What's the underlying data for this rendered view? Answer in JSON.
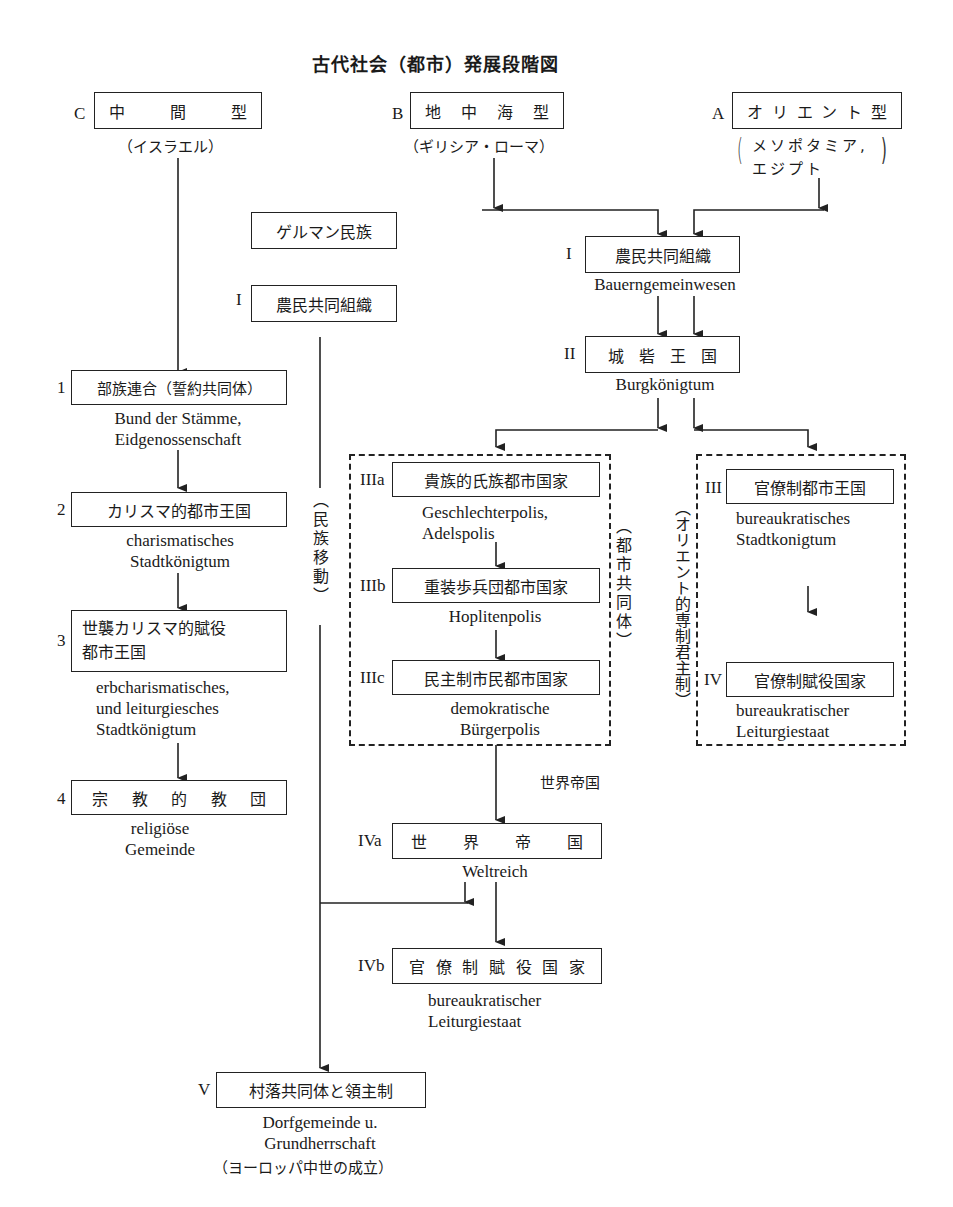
{
  "title": "古代社会（都市）発展段階図",
  "origins": {
    "C": {
      "letter": "C",
      "label": [
        "中",
        "間",
        "型"
      ],
      "sub": "（イスラエル）"
    },
    "B": {
      "letter": "B",
      "label": [
        "地",
        "中",
        "海",
        "型"
      ],
      "sub": "（ギリシア・ローマ）"
    },
    "A": {
      "letter": "A",
      "label": [
        "オ",
        "リ",
        "エ",
        "ン",
        "ト",
        "型"
      ],
      "sub_line1": "メソポタミア,",
      "sub_line2": "エジプト",
      "paren_open": "(",
      "paren_close": ")"
    }
  },
  "germanic": {
    "people": "ゲルマン民族",
    "stage_num": "I",
    "stage": "農民共同組織",
    "migration": "（民族移動）"
  },
  "israel_track": [
    {
      "num": "1",
      "jp": "部族連合（誓約共同体）",
      "de": [
        "Bund der Stämme,",
        "Eidgenossenschaft"
      ]
    },
    {
      "num": "2",
      "jp": "カリスマ的都市王国",
      "de": [
        "charismatisches",
        "Stadtkönigtum"
      ]
    },
    {
      "num": "3",
      "jp": [
        "世襲カリスマ的賦役",
        "都市王国"
      ],
      "de": [
        "erbcharismatisches,",
        "und leiturgiesches",
        "Stadtkönigtum"
      ]
    },
    {
      "num": "4",
      "jp": [
        "宗",
        "教",
        "的",
        "教",
        "団"
      ],
      "de": [
        "religiöse",
        "Gemeinde"
      ]
    }
  ],
  "main_track": {
    "stage1": {
      "num": "I",
      "jp": "農民共同組織",
      "de": "Bauerngemeinwesen"
    },
    "stage2": {
      "num": "II",
      "jp": [
        "城",
        "砦",
        "王",
        "国"
      ],
      "de": "Burgkönigtum"
    }
  },
  "city_community": {
    "group_label": "（都市共同体）",
    "stages": [
      {
        "num": "IIIa",
        "jp": "貴族的氏族都市国家",
        "de": [
          "Geschlechterpolis,",
          "Adelspolis"
        ]
      },
      {
        "num": "IIIb",
        "jp": "重装歩兵団都市国家",
        "de": [
          "Hoplitenpolis"
        ]
      },
      {
        "num": "IIIc",
        "jp": "民主制市民都市国家",
        "de": [
          "demokratische",
          "Bürgerpolis"
        ]
      }
    ]
  },
  "oriental_despotism": {
    "group_label": "（オリエント的専制君主制）",
    "stages": [
      {
        "num": "III",
        "jp": "官僚制都市王国",
        "de": [
          "bureaukratisches",
          "Stadtkonigtum"
        ]
      },
      {
        "num": "IV",
        "jp": "官僚制賦役国家",
        "de": [
          "bureaukratischer",
          "Leiturgiestaat"
        ]
      }
    ]
  },
  "world_empire": {
    "arrow_label": "世界帝国",
    "IVa": {
      "num": "IVa",
      "jp": [
        "世",
        "界",
        "帝",
        "国"
      ],
      "de": "Weltreich"
    },
    "IVb": {
      "num": "IVb",
      "jp": [
        "官",
        "僚",
        "制",
        "賦",
        "役",
        "国",
        "家"
      ],
      "de": [
        "bureaukratischer",
        "Leiturgiestaat"
      ]
    }
  },
  "final": {
    "num": "V",
    "jp": "村落共同体と領主制",
    "de": [
      "Dorfgemeinde u.",
      "Grundherrschaft"
    ],
    "note": "（ヨーロッパ中世の成立）"
  }
}
